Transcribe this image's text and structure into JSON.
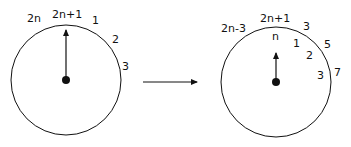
{
  "diagram": {
    "left_clock": {
      "labels": {
        "top_left": "2n",
        "top": "2n+1",
        "right_1": "1",
        "right_2": "2",
        "right_3": "3"
      }
    },
    "transition_arrow": "right-arrow",
    "right_clock": {
      "outer_labels": {
        "top_left": "2n-3",
        "top": "2n+1",
        "right_1": "3",
        "right_2": "5",
        "right_3": "7"
      },
      "inner_labels": {
        "top": "n",
        "i1": "1",
        "i2": "2",
        "i3": "3"
      }
    },
    "colors": {
      "stroke": "#111111",
      "background": "#ffffff"
    }
  }
}
